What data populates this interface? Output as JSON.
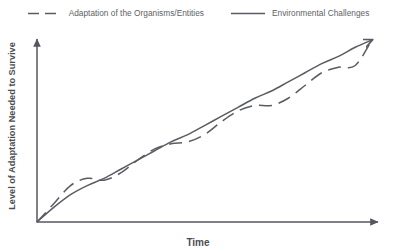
{
  "chart_data": {
    "type": "line",
    "title": "",
    "subtitle": "",
    "xlabel": "Time",
    "ylabel": "Level of Adaptation Needed to Survive",
    "grid": false,
    "legend_position": "top-center",
    "xlim": [
      0,
      100
    ],
    "ylim": [
      0,
      100
    ],
    "axis_ticks": {
      "x": [],
      "y": []
    },
    "annotations": [],
    "series": [
      {
        "name": "Adaptation of the Organisms/Entities",
        "style": "dashed",
        "color": "#5a5c63",
        "description": "Oscillates sinusoidally around the environmental challenges trend line, alternately lagging and overshooting",
        "x": [
          0,
          5,
          10,
          15,
          20,
          25,
          30,
          35,
          40,
          45,
          50,
          55,
          60,
          65,
          70,
          75,
          80,
          85,
          90,
          95,
          100
        ],
        "y": [
          0,
          10,
          20,
          24,
          23,
          27,
          34,
          40,
          43,
          44,
          48,
          55,
          61,
          64,
          64,
          68,
          75,
          82,
          85,
          86,
          100
        ]
      },
      {
        "name": "Environmental Challenges",
        "style": "solid",
        "color": "#5a5c63",
        "description": "Steady near-linear rise from origin to upper right",
        "x": [
          0,
          5,
          10,
          15,
          20,
          25,
          30,
          35,
          40,
          45,
          50,
          55,
          60,
          65,
          70,
          75,
          80,
          85,
          90,
          95,
          100
        ],
        "y": [
          0,
          8,
          15,
          20,
          24,
          29,
          34,
          39,
          44,
          48,
          53,
          58,
          63,
          68,
          72,
          77,
          82,
          87,
          91,
          96,
          100
        ]
      }
    ]
  },
  "legend": {
    "entries": [
      {
        "label": "Adaptation of the Organisms/Entities",
        "style": "dashed"
      },
      {
        "label": "Environmental Challenges",
        "style": "solid"
      }
    ]
  },
  "axes": {
    "x_title": "Time",
    "y_title": "Level of Adaptation Needed to Survive"
  },
  "colors": {
    "line": "#5a5c63",
    "axis": "#55575e",
    "label": "#4a4c53",
    "legend_text": "#5d5f66",
    "background": "#ffffff"
  }
}
